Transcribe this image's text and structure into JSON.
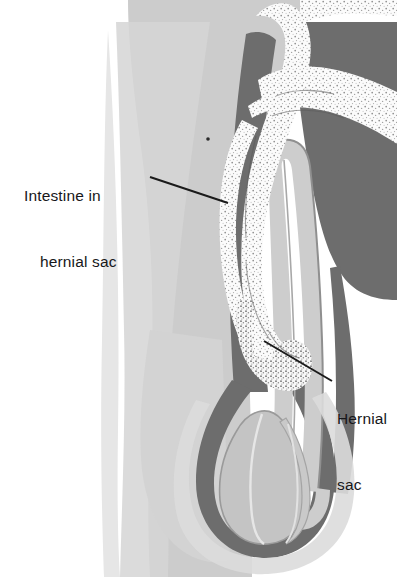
{
  "figure": {
    "type": "medical-illustration",
    "width": 420,
    "height": 577,
    "background_color": "#ffffff"
  },
  "labels": [
    {
      "id": "intestine-in-hernial-sac",
      "line1": "Intestine in",
      "line2": "hernial sac",
      "leader_from": [
        150,
        177
      ],
      "leader_to": [
        228,
        203
      ]
    },
    {
      "id": "hernial-sac",
      "line1": "Hernial",
      "line2": "sac",
      "leader_from": [
        332,
        381
      ],
      "leader_to": [
        264,
        341
      ]
    }
  ],
  "palette": {
    "background": "#ffffff",
    "body_light": "#cccccc",
    "body_pale": "#e2e2e2",
    "wall_dark": "#6d6d6d",
    "sac_light": "#cdcdcd",
    "sac_outline": "#8a8a8a",
    "intestine_fill": "#fbfbfb",
    "intestine_stipple": "#4a4a4a",
    "testis_fill": "#c4c4c4",
    "testis_outline": "#8c8c8c",
    "leader_line": "#1a1a1a",
    "text": "#17171a"
  },
  "structures": [
    {
      "name": "abdominal-wall-and-thigh",
      "color": "#cccccc"
    },
    {
      "name": "scrotal-wall-dark",
      "color": "#6d6d6d"
    },
    {
      "name": "hernial-sac-tube",
      "color": "#cdcdcd"
    },
    {
      "name": "intestine-loop",
      "color": "#fbfbfb"
    },
    {
      "name": "testis",
      "color": "#c4c4c4"
    },
    {
      "name": "epididymis",
      "color": "#c4c4c4"
    }
  ]
}
